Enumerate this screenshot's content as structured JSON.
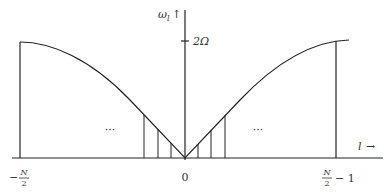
{
  "diagram": {
    "type": "dispersion-curve",
    "axes": {
      "y_label": "ω",
      "y_label_sub": "l",
      "y_arrow": "↑",
      "x_label": "l",
      "x_arrow": "→",
      "y_tick_label": "2Ω"
    },
    "x_ticks": {
      "left_num": "N",
      "left_den": "2",
      "left_sign": "−",
      "center": "0",
      "right_num": "N",
      "right_den": "2",
      "right_suffix": "− 1"
    },
    "ellipsis_left": "···",
    "ellipsis_right": "···",
    "colors": {
      "line": "#222222",
      "background": "#ffffff"
    }
  }
}
